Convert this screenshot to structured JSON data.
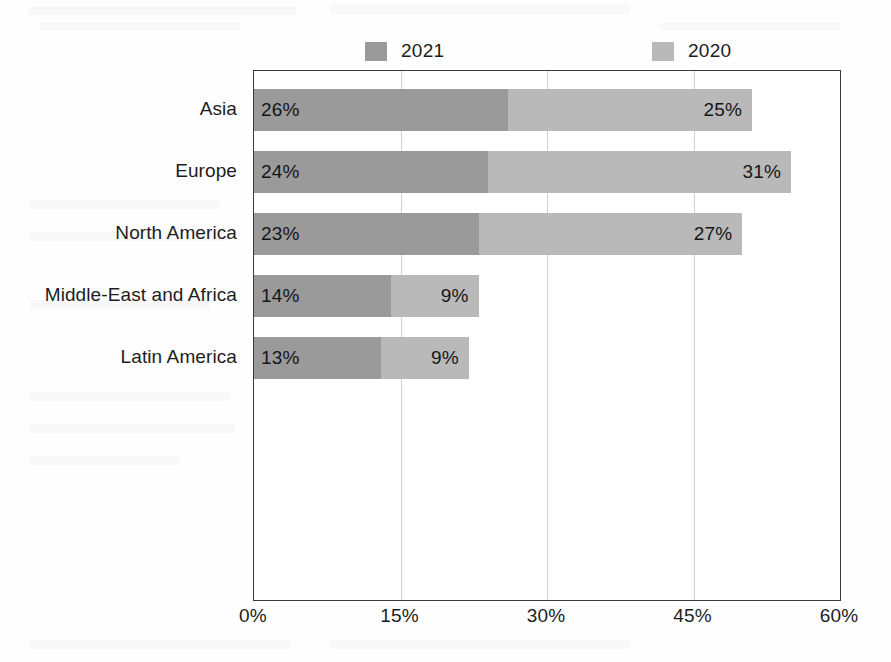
{
  "chart_data": {
    "type": "bar",
    "orientation": "horizontal",
    "stacked": true,
    "title": "",
    "xlabel": "",
    "ylabel": "",
    "categories": [
      "Asia",
      "Europe",
      "North America",
      "Middle-East and Africa",
      "Latin America"
    ],
    "series": [
      {
        "name": "2021",
        "color": "#9a9a9a",
        "values": [
          26,
          24,
          23,
          14,
          13
        ],
        "value_labels": [
          "26%",
          "24%",
          "23%",
          "14%",
          "13%"
        ]
      },
      {
        "name": "2020",
        "color": "#b9b9b9",
        "values": [
          25,
          31,
          27,
          9,
          9
        ],
        "value_labels": [
          "25%",
          "31%",
          "27%",
          "9%",
          "9%"
        ]
      }
    ],
    "totals": [
      51,
      55,
      50,
      23,
      22
    ],
    "xlim": [
      0,
      60
    ],
    "xticks": [
      0,
      15,
      30,
      45,
      60
    ],
    "xtick_labels": [
      "0%",
      "15%",
      "30%",
      "45%",
      "60%"
    ],
    "grid": true,
    "grid_axis": "x",
    "legend": {
      "position": "top",
      "entries": [
        {
          "label": "2021",
          "color": "#9a9a9a"
        },
        {
          "label": "2020",
          "color": "#b9b9b9"
        }
      ]
    },
    "units": "percent"
  },
  "axis_color": "#3a3a3a",
  "gridline_color": "#d2d2d2",
  "background_color": "#fefefe"
}
